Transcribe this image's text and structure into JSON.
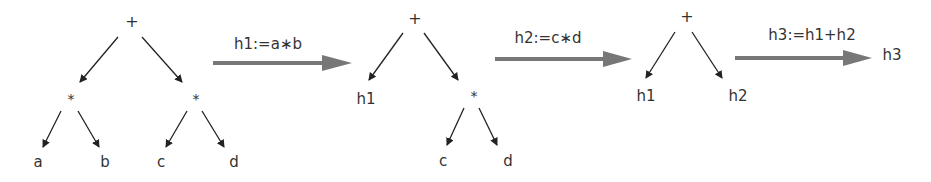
{
  "diagram": {
    "colors": {
      "edge": "#222222",
      "step_arrow": "#777777",
      "text": "#333333"
    },
    "stages": [
      {
        "nodes": {
          "root": "+",
          "left": "*",
          "right": "*",
          "a": "a",
          "b": "b",
          "c": "c",
          "d": "d"
        }
      },
      {
        "nodes": {
          "root": "+",
          "left": "h1",
          "right": "*",
          "c": "c",
          "d": "d"
        }
      },
      {
        "nodes": {
          "root": "+",
          "left": "h1",
          "right": "h2"
        }
      },
      {
        "nodes": {
          "result": "h3"
        }
      }
    ],
    "steps": [
      {
        "label": "h1:=a∗b"
      },
      {
        "label": "h2:=c∗d"
      },
      {
        "label": "h3:=h1+h2"
      }
    ]
  }
}
